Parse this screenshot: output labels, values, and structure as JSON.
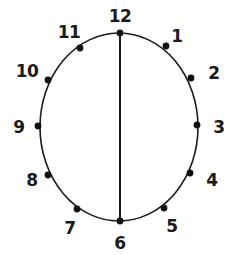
{
  "figure": {
    "type": "clock-face-diagram",
    "title": "",
    "background_color": "#ffffff",
    "stroke_color": "#1a1a1a",
    "label_color": "#1a1a1a",
    "dot_color": "#111111",
    "circle": {
      "center_x": 119,
      "center_y": 127,
      "radius_x": 79,
      "radius_y": 94,
      "stroke_width": 1.6
    },
    "diameter_line": {
      "name": "vertical-diameter-12-to-6",
      "x1": 120,
      "y1": 33,
      "x2": 120,
      "y2": 221,
      "stroke_width": 2
    },
    "hours": [
      {
        "label": "1",
        "dot_x": 166,
        "dot_y": 46,
        "label_x": 177,
        "label_y": 36
      },
      {
        "label": "2",
        "dot_x": 191,
        "dot_y": 78,
        "label_x": 214,
        "label_y": 73
      },
      {
        "label": "3",
        "dot_x": 197,
        "dot_y": 125,
        "label_x": 219,
        "label_y": 127
      },
      {
        "label": "4",
        "dot_x": 190,
        "dot_y": 173,
        "label_x": 212,
        "label_y": 180
      },
      {
        "label": "5",
        "dot_x": 164,
        "dot_y": 208,
        "label_x": 172,
        "label_y": 226
      },
      {
        "label": "6",
        "dot_x": 120,
        "dot_y": 221,
        "label_x": 120,
        "label_y": 243
      },
      {
        "label": "7",
        "dot_x": 77,
        "dot_y": 209,
        "label_x": 70,
        "label_y": 228
      },
      {
        "label": "8",
        "dot_x": 48,
        "dot_y": 175,
        "label_x": 32,
        "label_y": 180
      },
      {
        "label": "9",
        "dot_x": 38,
        "dot_y": 126,
        "label_x": 19,
        "label_y": 127
      },
      {
        "label": "10",
        "dot_x": 48,
        "dot_y": 80,
        "label_x": 27,
        "label_y": 71
      },
      {
        "label": "11",
        "dot_x": 80,
        "dot_y": 48,
        "label_x": 69,
        "label_y": 32
      },
      {
        "label": "12",
        "dot_x": 120,
        "dot_y": 33,
        "label_x": 120,
        "label_y": 16
      }
    ],
    "dot_radius": 3.4
  }
}
